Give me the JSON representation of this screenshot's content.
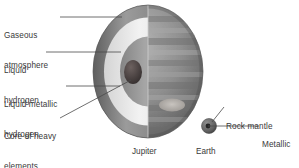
{
  "figure": {
    "background": "#ffffff",
    "text_color": "#3a3a3a",
    "leader_color": "#4a4a4a"
  },
  "jupiter": {
    "caption": "Jupiter",
    "labels": [
      {
        "id": "gaseous-atmosphere",
        "line1": "Gaseous",
        "line2": "atmosphere"
      },
      {
        "id": "liquid-hydrogen",
        "line1": "Liquid",
        "line2": "hydrogen"
      },
      {
        "id": "liquid-metallic-hydrogen",
        "line1": "Liquid metallic",
        "line2": "hydrogen"
      },
      {
        "id": "core-of-heavy-elements",
        "line1": "Core of heavy",
        "line2": "elements"
      }
    ],
    "layers": [
      {
        "name": "gaseous-atmosphere",
        "color": "#8d8d8d"
      },
      {
        "name": "liquid-hydrogen",
        "color": "#ececec"
      },
      {
        "name": "liquid-metallic-hydrogen",
        "color": "#9a9a9a"
      },
      {
        "name": "core-of-heavy-elements",
        "color": "#4b4444"
      }
    ],
    "surface": {
      "name": "banded-cloud-surface",
      "base_color": "#8a8a8a",
      "great_red_spot_color": "#b6b2ad"
    }
  },
  "earth": {
    "caption": "Earth",
    "labels": [
      {
        "id": "rock-mantle",
        "line1": "Rock mantle",
        "line2": ""
      },
      {
        "id": "metallic-core",
        "line1": "Metallic",
        "line2": "core"
      }
    ],
    "colors": {
      "mantle": "#6e6e6e",
      "core": "#2e2e2e"
    }
  }
}
